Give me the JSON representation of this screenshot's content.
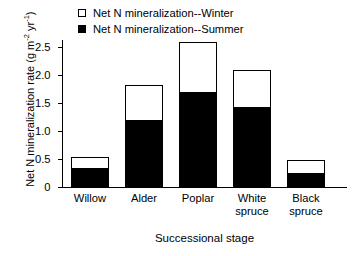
{
  "chart_data": {
    "type": "bar",
    "subtype": "stacked",
    "title": "",
    "xlabel": "Successional stage",
    "ylabel": "Net N mineralization rate (g m-2 yr-1)",
    "ylabel_parts": {
      "prefix": "Net N mineralization rate (g m",
      "sup1": "-2",
      "mid": " yr",
      "sup2": "-1",
      "suffix": ")"
    },
    "categories": [
      "Willow",
      "Alder",
      "Poplar",
      "White spruce",
      "Black spruce"
    ],
    "category_lines": [
      [
        "Willow"
      ],
      [
        "Alder"
      ],
      [
        "Poplar"
      ],
      [
        "White",
        "spruce"
      ],
      [
        "Black",
        "spruce"
      ]
    ],
    "series": [
      {
        "name": "Net N mineralization--Summer",
        "marker": "filled-square",
        "color": "#000000",
        "values": [
          0.34,
          1.2,
          1.69,
          1.43,
          0.25
        ]
      },
      {
        "name": "Net N mineralization--Winter",
        "marker": "open-square",
        "color": "#ffffff",
        "values": [
          0.19,
          0.62,
          0.9,
          0.65,
          0.22
        ]
      }
    ],
    "totals": [
      0.53,
      1.82,
      2.59,
      2.08,
      0.47
    ],
    "ylim": [
      0,
      2.65
    ],
    "yticks": [
      0,
      0.5,
      1.0,
      1.5,
      2.0,
      2.5
    ],
    "ytick_labels": [
      "0",
      "0.5",
      "1.0",
      "1.5",
      "2.0",
      "2.5"
    ],
    "grid": false,
    "legend_position": "top-center",
    "axis_color": "#000000"
  },
  "legend": {
    "items": [
      {
        "label": "Net N mineralization--Winter",
        "marker": "open-square"
      },
      {
        "label": "Net N mineralization--Summer",
        "marker": "filled-square"
      }
    ]
  }
}
